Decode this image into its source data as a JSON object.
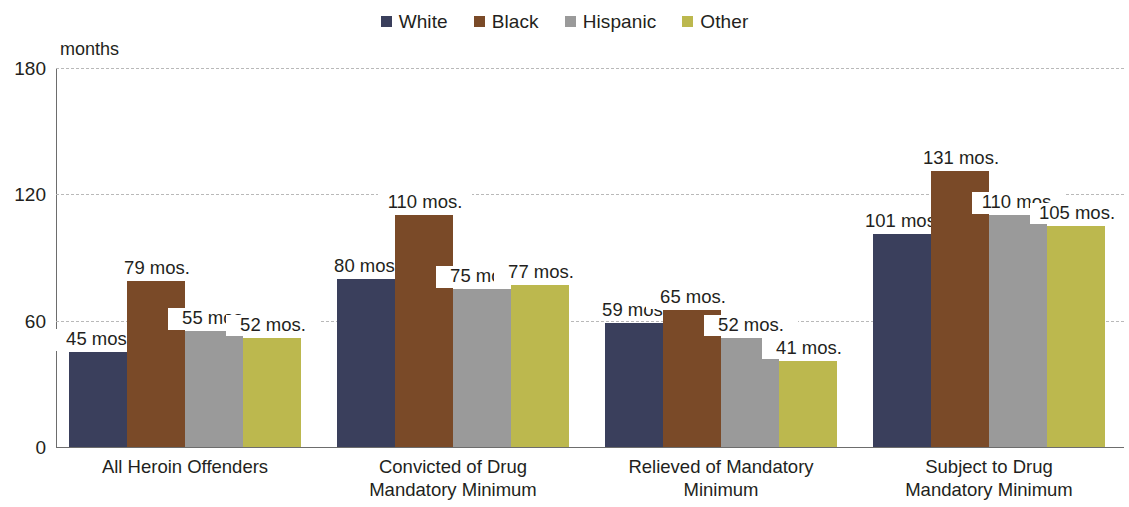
{
  "legend": {
    "items": [
      {
        "label": "White",
        "color": "#3a3f5c"
      },
      {
        "label": "Black",
        "color": "#7a4a28"
      },
      {
        "label": "Hispanic",
        "color": "#9a9a9a"
      },
      {
        "label": "Other",
        "color": "#bcb84e"
      }
    ]
  },
  "axis": {
    "y_title": "months",
    "y_ticks": [
      "0",
      "60",
      "120",
      "180"
    ]
  },
  "chart_data": {
    "type": "bar",
    "title": "",
    "xlabel": "",
    "ylabel": "months",
    "ylim": [
      0,
      180
    ],
    "yticks": [
      0,
      60,
      120,
      180
    ],
    "grid": true,
    "legend_position": "top-center",
    "value_suffix": " mos.",
    "categories": [
      "All Heroin Offenders",
      "Convicted of Drug Mandatory Minimum",
      "Relieved of Mandatory Minimum",
      "Subject to Drug Mandatory Minimum"
    ],
    "category_lines": [
      [
        "All Heroin Offenders"
      ],
      [
        "Convicted of Drug",
        "Mandatory Minimum"
      ],
      [
        "Relieved of Mandatory",
        "Minimum"
      ],
      [
        "Subject to Drug",
        "Mandatory Minimum"
      ]
    ],
    "series": [
      {
        "name": "White",
        "color": "#3a3f5c",
        "values": [
          45,
          80,
          59,
          101
        ],
        "labels": [
          "45 mos.",
          "80 mos.",
          "59 mos.",
          "101 mos."
        ]
      },
      {
        "name": "Black",
        "color": "#7a4a28",
        "values": [
          79,
          110,
          65,
          131
        ],
        "labels": [
          "79 mos.",
          "110 mos.",
          "65 mos.",
          "131 mos."
        ]
      },
      {
        "name": "Hispanic",
        "color": "#9a9a9a",
        "values": [
          55,
          75,
          52,
          110
        ],
        "labels": [
          "55 mos.",
          "75 mos.",
          "52 mos.",
          "110 mos."
        ]
      },
      {
        "name": "Other",
        "color": "#bcb84e",
        "values": [
          52,
          77,
          41,
          105
        ],
        "labels": [
          "52 mos.",
          "77 mos.",
          "41 mos.",
          "105 mos."
        ]
      }
    ]
  }
}
